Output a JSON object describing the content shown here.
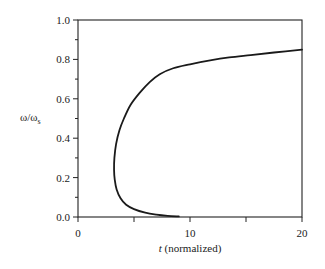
{
  "chart_data": {
    "type": "line",
    "title": "",
    "xlabel_var": "t",
    "xlabel_rest": " (normalized)",
    "xlabel": "t (normalized)",
    "ylabel": "ω/ωs",
    "ylabel_main": "ω/ω",
    "ylabel_sub": "s",
    "xlim": [
      0,
      20
    ],
    "ylim": [
      0.0,
      1.0
    ],
    "x_ticks": [
      0,
      5,
      10,
      15,
      20
    ],
    "x_tick_labels": [
      "0",
      "",
      "10",
      "",
      "20"
    ],
    "y_ticks": [
      0.0,
      0.2,
      0.4,
      0.6,
      0.8,
      1.0
    ],
    "y_tick_labels": [
      "0.0",
      "0.2",
      "0.4",
      "0.6",
      "0.8",
      "1.0"
    ],
    "y_minor_ticks": [
      0.1,
      0.3,
      0.5,
      0.7,
      0.9
    ],
    "grid": false,
    "legend": null,
    "series": [
      {
        "name": "omega_ratio_vs_t",
        "color": "#1a1a1a",
        "points": [
          [
            9.0,
            0.003
          ],
          [
            8.0,
            0.006
          ],
          [
            7.0,
            0.012
          ],
          [
            6.0,
            0.022
          ],
          [
            5.0,
            0.04
          ],
          [
            4.3,
            0.062
          ],
          [
            3.8,
            0.095
          ],
          [
            3.45,
            0.14
          ],
          [
            3.28,
            0.19
          ],
          [
            3.22,
            0.24
          ],
          [
            3.25,
            0.3
          ],
          [
            3.4,
            0.37
          ],
          [
            3.7,
            0.44
          ],
          [
            4.1,
            0.5
          ],
          [
            4.7,
            0.57
          ],
          [
            5.5,
            0.63
          ],
          [
            6.4,
            0.685
          ],
          [
            7.3,
            0.725
          ],
          [
            8.5,
            0.755
          ],
          [
            10.0,
            0.775
          ],
          [
            11.8,
            0.795
          ],
          [
            13.5,
            0.81
          ],
          [
            15.4,
            0.822
          ],
          [
            17.5,
            0.835
          ],
          [
            20.0,
            0.85
          ]
        ]
      }
    ]
  }
}
